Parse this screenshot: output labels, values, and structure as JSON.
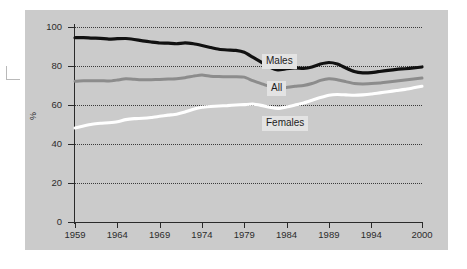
{
  "figure": {
    "background_color": "#cbcbcb",
    "page_color": "#ffffff",
    "registration_mark": "crop-mark"
  },
  "axis": {
    "y_title": "%",
    "y_ticks": [
      "0",
      "20",
      "40",
      "60",
      "80",
      "100"
    ],
    "x_ticks": [
      "1959",
      "1964",
      "1969",
      "1974",
      "1979",
      "1984",
      "1989",
      "1994",
      "2000"
    ]
  },
  "labels": {
    "males": "Males",
    "all": "All",
    "females": "Females"
  },
  "colors": {
    "males": "#111111",
    "all": "#8c8c8c",
    "females": "#ffffff",
    "grid": "#3a3a3a",
    "axis": "#2a2a2a",
    "label_box": "#e3e3e3"
  },
  "chart_data": {
    "type": "line",
    "title": "",
    "xlabel": "",
    "ylabel": "%",
    "xlim": [
      1959,
      2000
    ],
    "ylim": [
      0,
      100
    ],
    "grid": true,
    "gridlines_y": [
      20,
      40,
      60,
      80,
      100
    ],
    "legend_position": "inline-annotations",
    "x": [
      1959,
      1960,
      1961,
      1962,
      1963,
      1964,
      1965,
      1966,
      1967,
      1968,
      1969,
      1970,
      1971,
      1972,
      1973,
      1974,
      1975,
      1976,
      1977,
      1978,
      1979,
      1980,
      1981,
      1982,
      1983,
      1984,
      1985,
      1986,
      1987,
      1988,
      1989,
      1990,
      1991,
      1992,
      1993,
      1994,
      1995,
      1996,
      1997,
      1998,
      1999,
      2000
    ],
    "series": [
      {
        "name": "Males",
        "color": "#111111",
        "values": [
          94.5,
          94.6,
          94.3,
          94.2,
          93.8,
          94.0,
          94.1,
          93.6,
          92.9,
          92.3,
          91.8,
          91.7,
          91.4,
          91.9,
          91.4,
          90.5,
          89.5,
          88.6,
          88.2,
          88.0,
          87.0,
          84.5,
          82.0,
          79.5,
          78.0,
          78.6,
          79.0,
          78.8,
          79.5,
          81.0,
          81.8,
          81.0,
          79.0,
          77.2,
          76.5,
          76.6,
          77.2,
          77.8,
          78.3,
          78.6,
          79.0,
          79.5
        ]
      },
      {
        "name": "All",
        "color": "#8c8c8c",
        "values": [
          72.2,
          72.4,
          72.4,
          72.5,
          72.3,
          72.8,
          73.4,
          73.2,
          72.9,
          73.0,
          73.1,
          73.3,
          73.5,
          74.0,
          74.8,
          75.4,
          74.8,
          74.6,
          74.5,
          74.5,
          74.3,
          72.5,
          71.0,
          69.5,
          68.5,
          69.0,
          69.6,
          70.0,
          71.0,
          72.6,
          73.5,
          73.0,
          72.0,
          71.0,
          70.8,
          71.0,
          71.3,
          71.8,
          72.3,
          72.8,
          73.3,
          73.8
        ]
      },
      {
        "name": "Females",
        "color": "#ffffff",
        "values": [
          48.2,
          49.2,
          50.1,
          50.6,
          50.9,
          51.4,
          52.5,
          53.0,
          53.2,
          53.6,
          54.2,
          54.8,
          55.3,
          56.4,
          57.8,
          58.8,
          59.2,
          59.5,
          59.7,
          60.0,
          60.2,
          60.5,
          59.8,
          58.8,
          58.2,
          59.0,
          60.0,
          61.0,
          62.4,
          63.8,
          65.0,
          65.4,
          65.2,
          65.0,
          65.2,
          65.6,
          66.2,
          66.8,
          67.4,
          68.0,
          68.8,
          69.6
        ]
      }
    ]
  }
}
